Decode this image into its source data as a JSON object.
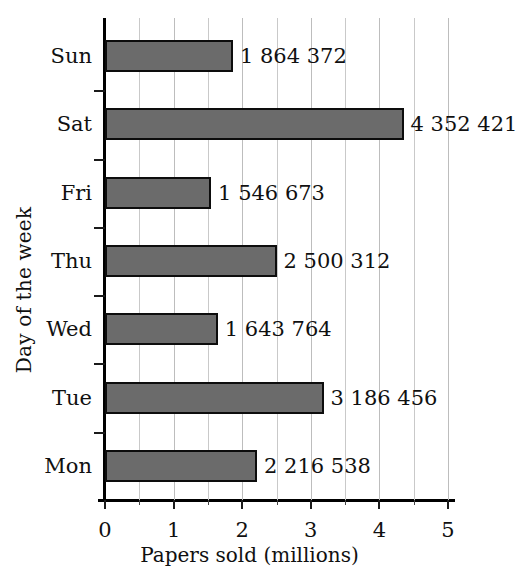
{
  "chart_data": {
    "type": "bar",
    "orientation": "horizontal",
    "title": "",
    "xlabel": "Papers sold (millions)",
    "ylabel": "Day of the week",
    "categories": [
      "Mon",
      "Tue",
      "Wed",
      "Thu",
      "Fri",
      "Sat",
      "Sun"
    ],
    "values": [
      2216538,
      3186456,
      1643764,
      2500312,
      1546673,
      4352421,
      1864372
    ],
    "value_labels": [
      "2 216 538",
      "3 186 456",
      "1 643 764",
      "2 500 312",
      "1 546 673",
      "4 352 421",
      "1 864 372"
    ],
    "values_millions": [
      2.216538,
      3.186456,
      1.643764,
      2.500312,
      1.546673,
      4.352421,
      1.864372
    ],
    "xlim": [
      0,
      5
    ],
    "xticks": [
      0,
      1,
      2,
      3,
      4,
      5
    ],
    "xtick_labels": [
      "0",
      "1",
      "2",
      "3",
      "4",
      "5"
    ],
    "x_minor_ticks": [
      0.5,
      1.5,
      2.5,
      3.5,
      4.5
    ],
    "grid": "vertical",
    "legend": "none",
    "bar_color": "#6b6b6b",
    "bar_border_color": "#0d0d0d",
    "gridline_color": "#c9c9c9",
    "axis_color": "#000000",
    "display_order_top_to_bottom": [
      "Sun",
      "Sat",
      "Fri",
      "Thu",
      "Wed",
      "Tue",
      "Mon"
    ]
  }
}
